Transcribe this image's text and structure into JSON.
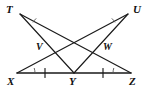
{
  "figure": {
    "width": 147,
    "height": 92,
    "background_color": "#ffffff",
    "line_color": "#1a1a1a",
    "mark_color": "#555555"
  },
  "labels": {
    "T": "T",
    "U": "U",
    "V": "V",
    "W": "W",
    "X": "X",
    "Y": "Y",
    "Z": "Z"
  },
  "points": [
    {
      "name": "T",
      "label": "T",
      "x": 20,
      "y": 14,
      "label_x": 6,
      "label_y": 6
    },
    {
      "name": "U",
      "label": "U",
      "x": 128,
      "y": 14,
      "label_x": 133,
      "label_y": 6
    },
    {
      "name": "V",
      "label": "V",
      "x": 47,
      "y": 52,
      "label_x": 36,
      "label_y": 43
    },
    {
      "name": "W",
      "label": "W",
      "x": 100,
      "y": 52,
      "label_x": 101,
      "label_y": 43
    },
    {
      "name": "X",
      "label": "X",
      "x": 17,
      "y": 73,
      "label_x": 7,
      "label_y": 76
    },
    {
      "name": "Y",
      "label": "Y",
      "x": 74,
      "y": 73,
      "label_x": 70,
      "label_y": 76
    },
    {
      "name": "Z",
      "label": "Z",
      "x": 131,
      "y": 73,
      "label_x": 130,
      "label_y": 76
    }
  ],
  "segments": [
    {
      "name": "segment-XZ",
      "from": "X",
      "to": "Z",
      "style": "base"
    },
    {
      "name": "segment-TY",
      "from": "T",
      "to": "Y",
      "style": "line"
    },
    {
      "name": "segment-TZ",
      "from": "T",
      "to": "Z",
      "style": "line"
    },
    {
      "name": "segment-UY",
      "from": "U",
      "to": "Y",
      "style": "line"
    },
    {
      "name": "segment-UX",
      "from": "U",
      "to": "X",
      "style": "line"
    }
  ],
  "tick_marks": [
    {
      "name": "tick-XY",
      "on_segment": "XY",
      "count": 1,
      "x": 45,
      "y": 73
    },
    {
      "name": "tick-YZ",
      "on_segment": "YZ",
      "count": 1,
      "x": 103,
      "y": 73
    }
  ],
  "angle_marks": [
    {
      "name": "angle-T",
      "vertex": "T",
      "marks": 1
    },
    {
      "name": "angle-U",
      "vertex": "U",
      "marks": 1
    },
    {
      "name": "angle-X",
      "vertex": "X",
      "marks": 1
    },
    {
      "name": "angle-Z",
      "vertex": "Z",
      "marks": 1
    }
  ]
}
